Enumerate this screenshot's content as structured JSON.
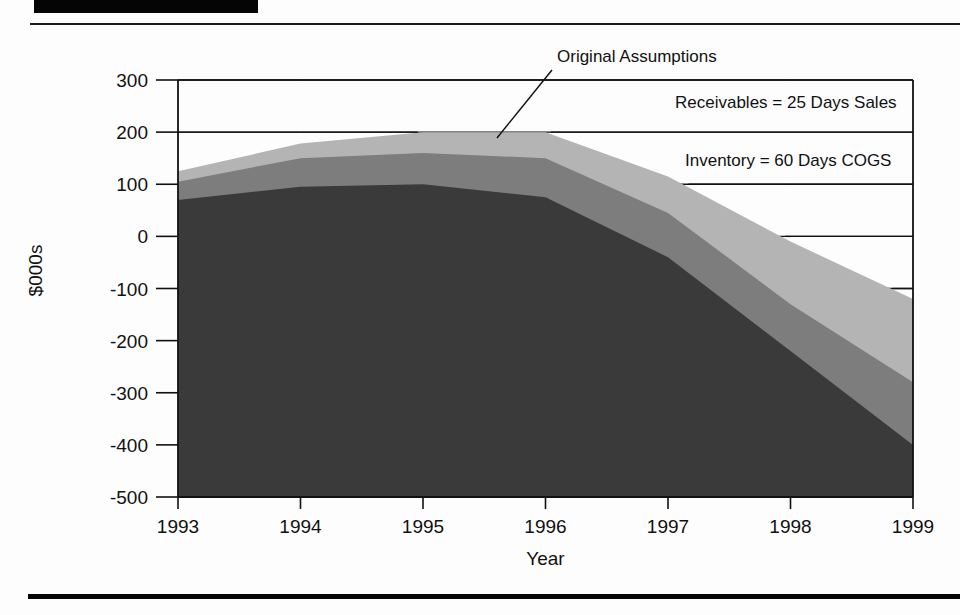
{
  "document": {
    "header_bar_present": true,
    "footer_rule_present": true
  },
  "chart_data": {
    "type": "area",
    "stacked": true,
    "title": "",
    "subtitle": "",
    "xlabel": "Year",
    "ylabel": "$000s",
    "x": [
      1993,
      1994,
      1995,
      1996,
      1997,
      1998,
      1999
    ],
    "xtick_labels": [
      "1993",
      "1994",
      "1995",
      "1996",
      "1997",
      "1998",
      "1999"
    ],
    "ytick_labels": [
      "300",
      "200",
      "100",
      "0",
      "-100",
      "-200",
      "-300",
      "-400",
      "-500"
    ],
    "ytick_values": [
      300,
      200,
      100,
      0,
      -100,
      -200,
      -300,
      -400,
      -500
    ],
    "xlim": [
      1993,
      1999
    ],
    "ylim": [
      -500,
      300
    ],
    "grid": true,
    "grid_axis": "y",
    "legend_position": "none",
    "series": [
      {
        "name": "Band 1 (bottom / darkest)",
        "color": "#3a3a3a",
        "values": [
          70,
          95,
          100,
          75,
          -40,
          -220,
          -400
        ]
      },
      {
        "name": "Band 2 (middle)",
        "color": "#7d7d7d",
        "values": [
          105,
          150,
          160,
          150,
          45,
          -130,
          -280
        ]
      },
      {
        "name": "Band 3 (top / lightest)",
        "color": "#b4b4b4",
        "values": [
          125,
          178,
          200,
          200,
          115,
          -10,
          -120
        ]
      }
    ],
    "baseline": -500,
    "annotations": [
      {
        "name": "original-assumptions",
        "text": "Original Assumptions",
        "x_px": 557,
        "y_px": 62,
        "anchor": "start",
        "leader_from": [
          552,
          70
        ],
        "leader_to": [
          497,
          138
        ]
      },
      {
        "name": "receivables-note",
        "text": "Receivables = 25 Days Sales",
        "x_px": 675,
        "y_px": 108,
        "anchor": "start",
        "leader_from": null,
        "leader_to": null
      },
      {
        "name": "inventory-note",
        "text": "Inventory = 60 Days COGS",
        "x_px": 685,
        "y_px": 166,
        "anchor": "start",
        "leader_from": null,
        "leader_to": null
      }
    ],
    "colors": {
      "band_top": "#b4b4b4",
      "band_middle": "#7d7d7d",
      "band_bottom": "#3a3a3a",
      "axis": "#111111",
      "grid": "#111111",
      "background": "#ffffff"
    }
  }
}
